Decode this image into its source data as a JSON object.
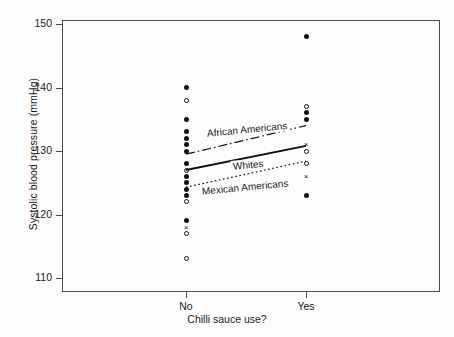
{
  "chart_data": {
    "type": "scatter",
    "title": "",
    "xlabel": "Chilli sauce use?",
    "ylabel": "Systolic blood pressure (mmHg)",
    "categories": [
      "No",
      "Yes"
    ],
    "ylim": [
      110,
      150
    ],
    "yticks": [
      110,
      120,
      130,
      140,
      150
    ],
    "ytick_labels": [
      "110",
      "120",
      "130",
      "140",
      "150"
    ],
    "grid": false,
    "legend_position": "inline-on-lines",
    "marker_styles": {
      "filled-circle": "closed circle",
      "open-circle": "open circle",
      "cross": "x mark"
    },
    "points": [
      {
        "x": "No",
        "y": 140,
        "marker": "filled-circle"
      },
      {
        "x": "No",
        "y": 138,
        "marker": "open-circle"
      },
      {
        "x": "No",
        "y": 135,
        "marker": "filled-circle"
      },
      {
        "x": "No",
        "y": 133,
        "marker": "filled-circle"
      },
      {
        "x": "No",
        "y": 132,
        "marker": "filled-circle"
      },
      {
        "x": "No",
        "y": 131,
        "marker": "filled-circle"
      },
      {
        "x": "No",
        "y": 130,
        "marker": "filled-circle"
      },
      {
        "x": "No",
        "y": 128,
        "marker": "filled-circle"
      },
      {
        "x": "No",
        "y": 127,
        "marker": "open-circle"
      },
      {
        "x": "No",
        "y": 126,
        "marker": "filled-circle"
      },
      {
        "x": "No",
        "y": 125,
        "marker": "filled-circle"
      },
      {
        "x": "No",
        "y": 124,
        "marker": "filled-circle"
      },
      {
        "x": "No",
        "y": 123,
        "marker": "filled-circle"
      },
      {
        "x": "No",
        "y": 122,
        "marker": "open-circle"
      },
      {
        "x": "No",
        "y": 119,
        "marker": "filled-circle"
      },
      {
        "x": "No",
        "y": 118,
        "marker": "cross"
      },
      {
        "x": "No",
        "y": 117,
        "marker": "open-circle"
      },
      {
        "x": "No",
        "y": 113,
        "marker": "open-circle"
      },
      {
        "x": "Yes",
        "y": 148,
        "marker": "filled-circle"
      },
      {
        "x": "Yes",
        "y": 137,
        "marker": "open-circle"
      },
      {
        "x": "Yes",
        "y": 136,
        "marker": "filled-circle"
      },
      {
        "x": "Yes",
        "y": 135,
        "marker": "filled-circle"
      },
      {
        "x": "Yes",
        "y": 131,
        "marker": "cross"
      },
      {
        "x": "Yes",
        "y": 130,
        "marker": "open-circle"
      },
      {
        "x": "Yes",
        "y": 128,
        "marker": "open-circle"
      },
      {
        "x": "Yes",
        "y": 126,
        "marker": "cross"
      },
      {
        "x": "Yes",
        "y": 123,
        "marker": "filled-circle"
      }
    ],
    "series": [
      {
        "name": "African Americans",
        "linestyle": "dash-dot",
        "color": "#111111",
        "points": [
          {
            "x": "No",
            "y": 129.5
          },
          {
            "x": "Yes",
            "y": 134.0
          }
        ]
      },
      {
        "name": "Whites",
        "linestyle": "solid",
        "color": "#111111",
        "points": [
          {
            "x": "No",
            "y": 127.0
          },
          {
            "x": "Yes",
            "y": 130.8
          }
        ]
      },
      {
        "name": "Mexican Americans",
        "linestyle": "dashed-dotted-short",
        "color": "#111111",
        "points": [
          {
            "x": "No",
            "y": 124.3
          },
          {
            "x": "Yes",
            "y": 128.4
          }
        ]
      }
    ],
    "line_labels": [
      {
        "text": "African Americans",
        "x": 205,
        "y": 128
      },
      {
        "text": "Whites",
        "x": 231,
        "y": 161
      },
      {
        "text": "Mexican Americans",
        "x": 200,
        "y": 186
      }
    ],
    "axis_color": "#4d4d4d",
    "background": "#fdfdfd"
  }
}
